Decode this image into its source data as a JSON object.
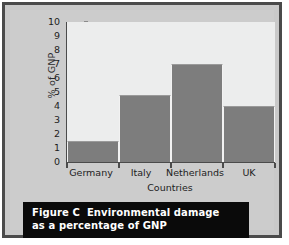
{
  "figure": {
    "caption_label": "Figure C",
    "caption_line1": "Environmental damage",
    "caption_line2": "as a percentage of GNP",
    "frame_color": "#4a4a4a",
    "panel_color": "#cccccc",
    "caption_bg": "#0a0a0a",
    "caption_fg": "#ffffff"
  },
  "chart_data": {
    "type": "bar",
    "title": "",
    "categories": [
      "Germany",
      "Italy",
      "Netherlands",
      "UK"
    ],
    "values": [
      1.5,
      4.8,
      7.0,
      4.0
    ],
    "xlabel": "Countries",
    "ylabel": "% of GNP",
    "ylim": [
      0,
      10
    ],
    "yticks": [
      0,
      1,
      2,
      3,
      4,
      5,
      6,
      7,
      8,
      9,
      10
    ],
    "ytick_labels": [
      "0",
      "1",
      "2",
      "3",
      "4",
      "5",
      "6",
      "7",
      "8",
      "9",
      "10"
    ],
    "grid": false,
    "legend": null,
    "bar_color": "#7d7d7d",
    "plot_bg": "#eceded",
    "axis_color": "#4b4b4b"
  }
}
